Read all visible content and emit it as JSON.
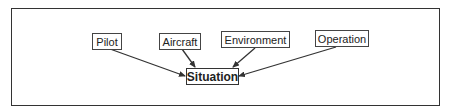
{
  "diagram": {
    "nodes": [
      {
        "id": "pilot",
        "label": "Pilot"
      },
      {
        "id": "aircraft",
        "label": "Aircraft"
      },
      {
        "id": "environment",
        "label": "Environment"
      },
      {
        "id": "operation",
        "label": "Operation"
      },
      {
        "id": "situation",
        "label": "Situation"
      }
    ],
    "edges": [
      {
        "from": "pilot",
        "to": "situation"
      },
      {
        "from": "aircraft",
        "to": "situation"
      },
      {
        "from": "environment",
        "to": "situation"
      },
      {
        "from": "operation",
        "to": "situation"
      }
    ],
    "colors": {
      "stroke": "#333333",
      "background": "#ffffff"
    }
  }
}
